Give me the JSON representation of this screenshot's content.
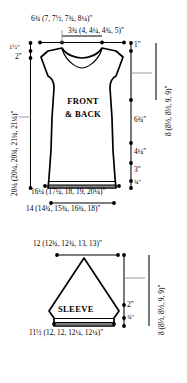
{
  "diagram": {
    "pieces": [
      {
        "name": "front-and-back",
        "label_line1": "FRONT",
        "label_line2": "& BACK",
        "measurements": {
          "shoulder_to_shoulder": "6¾ (7, 7½, 7¾, 8¼)\"",
          "neck_width": "3¾ (4, 4¼, 4¾, 5)\"",
          "shoulder_slope": "1½\"",
          "neck_depth": "2\"",
          "total_length_rotated": "20¼ (20¼, 20¾, 21¼, 21¼)\"",
          "shoulder_cap": "1\"",
          "armhole_depth_rotated": "8 (8½, 8½, 9, 9)\"",
          "side_seam": "6¾\"",
          "lower_body": "4¼\"",
          "waist_band": "3\"",
          "hem": "¾\"",
          "bust_upper": "16¼ (17¼, 18, 19, 20¼)\"",
          "hem_width": "14 (14¾, 15¾, 16¾, 18)\""
        }
      },
      {
        "name": "sleeve",
        "label": "SLEEVE",
        "measurements": {
          "top_width": "12 (12¾, 12¾, 13, 13)\"",
          "cuff_width": "11½ (12, 12, 12¼, 12¼)\"",
          "cuff_depth": "2\"",
          "hem": "¾\"",
          "sleeve_length_rotated": "8 (8½, 8½, 9, 9)\""
        }
      }
    ],
    "colors": {
      "outline": "#000000",
      "fill": "#ffffff",
      "dimension_line": "#000000",
      "leader_line": "#8a8a8a"
    }
  }
}
